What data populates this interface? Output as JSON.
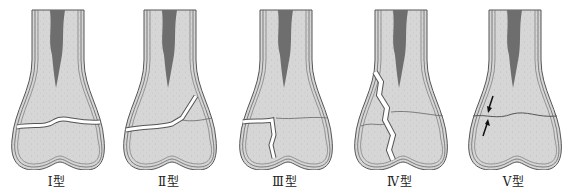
{
  "figure": {
    "colors": {
      "bone_fill": "#d4d4d4",
      "marrow": "#6e6e6e",
      "outline": "#555555",
      "fracture_gap": "#ffffff"
    },
    "panels": [
      {
        "id": "type-1",
        "label": "Ⅰ型",
        "x": 0
      },
      {
        "id": "type-2",
        "label": "Ⅱ型",
        "x": 112
      },
      {
        "id": "type-3",
        "label": "Ⅲ型",
        "x": 228
      },
      {
        "id": "type-4",
        "label": "Ⅳ型",
        "x": 343
      },
      {
        "id": "type-5",
        "label": "Ⅴ型",
        "x": 457
      }
    ]
  }
}
